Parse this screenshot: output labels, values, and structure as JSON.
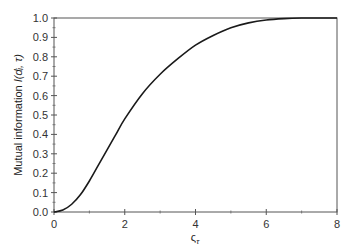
{
  "chart_data": {
    "type": "line",
    "title": "",
    "xlabel": "ς_τ",
    "xlabel_main": "ς",
    "xlabel_sub": "τ",
    "ylabel": "Mutual information I(dᵢ, τ)",
    "ylabel_main": "Mutual information ",
    "ylabel_math": "I(dᵢ, τ)",
    "xlim": [
      0,
      8
    ],
    "ylim": [
      0.0,
      1.0
    ],
    "x_ticks": [
      "0",
      "2",
      "4",
      "6",
      "8"
    ],
    "y_ticks": [
      "0.0",
      "0.1",
      "0.2",
      "0.3",
      "0.4",
      "0.5",
      "0.6",
      "0.7",
      "0.8",
      "0.9",
      "1.0"
    ],
    "grid": false,
    "legend": null,
    "series": [
      {
        "name": "I(dᵢ, τ)",
        "color": "#1a1a1a",
        "x": [
          0,
          0.25,
          0.5,
          0.75,
          1.0,
          1.25,
          1.5,
          1.75,
          2.0,
          2.5,
          3.0,
          3.5,
          4.0,
          4.5,
          5.0,
          5.5,
          6.0,
          6.5,
          7.0,
          7.5,
          8.0
        ],
        "y": [
          0.0,
          0.01,
          0.04,
          0.09,
          0.16,
          0.24,
          0.32,
          0.4,
          0.48,
          0.61,
          0.71,
          0.79,
          0.86,
          0.91,
          0.95,
          0.975,
          0.99,
          0.997,
          1.0,
          1.0,
          1.0
        ]
      }
    ]
  }
}
